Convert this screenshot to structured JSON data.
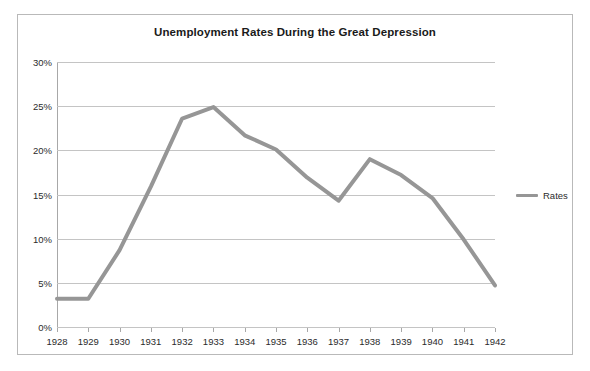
{
  "chart": {
    "title": "Unemployment Rates During the Great Depression"
  },
  "legend": {
    "position": "right",
    "entries": [
      {
        "label": "Rates",
        "color": "#969696"
      }
    ]
  },
  "axes": {
    "y_ticks": [
      "0%",
      "5%",
      "10%",
      "15%",
      "20%",
      "25%",
      "30%"
    ],
    "x_ticks": [
      "1928",
      "1929",
      "1930",
      "1931",
      "1932",
      "1933",
      "1934",
      "1935",
      "1936",
      "1937",
      "1938",
      "1939",
      "1940",
      "1941",
      "1942"
    ]
  },
  "colors": {
    "series": "#969696",
    "gridline": "#c4c4c4",
    "axis": "#a8a8a8",
    "border": "#b9b9b9",
    "text": "#2b2b2b",
    "background": "#ffffff"
  },
  "chart_data": {
    "type": "line",
    "title": "Unemployment Rates During the Great Depression",
    "xlabel": "",
    "ylabel": "",
    "x": [
      1928,
      1929,
      1930,
      1931,
      1932,
      1933,
      1934,
      1935,
      1936,
      1937,
      1938,
      1939,
      1940,
      1941,
      1942
    ],
    "categories": [
      "1928",
      "1929",
      "1930",
      "1931",
      "1932",
      "1933",
      "1934",
      "1935",
      "1936",
      "1937",
      "1938",
      "1939",
      "1940",
      "1941",
      "1942"
    ],
    "series": [
      {
        "name": "Rates",
        "color": "#969696",
        "values": [
          3.2,
          3.2,
          8.7,
          15.9,
          23.6,
          24.9,
          21.7,
          20.1,
          16.9,
          14.3,
          19.0,
          17.2,
          14.6,
          9.9,
          4.7
        ]
      }
    ],
    "ylim": [
      0,
      30
    ],
    "ytick_values": [
      0,
      5,
      10,
      15,
      20,
      25,
      30
    ],
    "ytick_labels": [
      "0%",
      "5%",
      "10%",
      "15%",
      "20%",
      "25%",
      "30%"
    ],
    "xlim": [
      1928,
      1942
    ],
    "grid": "horizontal",
    "legend_position": "right",
    "units": "percent"
  }
}
